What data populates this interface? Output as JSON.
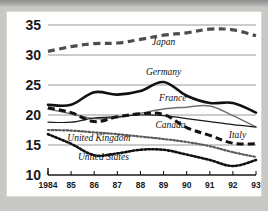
{
  "chart_data": {
    "type": "line",
    "title": "",
    "subtitle": "",
    "xlabel": "",
    "ylabel": "",
    "x": [
      1984,
      1985,
      1986,
      1987,
      1988,
      1989,
      1990,
      1991,
      1992,
      1993
    ],
    "xtick_labels": [
      "1984",
      "85",
      "86",
      "87",
      "88",
      "89",
      "90",
      "91",
      "92",
      "93"
    ],
    "ytick_labels": [
      "35",
      "30",
      "25",
      "20",
      "15",
      "10"
    ],
    "ytick_values": [
      35,
      30,
      25,
      20,
      15,
      10
    ],
    "ylim": [
      10,
      35
    ],
    "xlim": [
      1984,
      1993
    ],
    "grid": true,
    "legend_position": "inline-annotations",
    "series": [
      {
        "name": "Japan",
        "label": "Japan",
        "style": "thick-dashed",
        "color": "#4d4d4d",
        "values": [
          30.6,
          31.4,
          31.9,
          32.0,
          32.6,
          33.3,
          33.7,
          34.3,
          34.2,
          33.2
        ]
      },
      {
        "name": "Germany",
        "label": "Germany",
        "style": "thick-solid",
        "color": "#111111",
        "values": [
          21.7,
          21.7,
          23.8,
          23.4,
          24.0,
          25.5,
          23.2,
          22.0,
          22.0,
          20.4
        ]
      },
      {
        "name": "France",
        "label": "France",
        "style": "thin-solid",
        "color": "#707070",
        "values": [
          21.0,
          20.2,
          19.4,
          19.6,
          20.3,
          21.0,
          21.3,
          21.5,
          19.9,
          18.0
        ]
      },
      {
        "name": "Italy",
        "label": "Italy",
        "style": "thick-dashed-black",
        "color": "#111111",
        "values": [
          21.2,
          20.4,
          18.9,
          19.7,
          20.2,
          20.1,
          17.9,
          16.6,
          15.3,
          15.2
        ]
      },
      {
        "name": "Canada",
        "label": "Canada",
        "style": "thin-solid-black",
        "color": "#1a1a1a",
        "values": [
          18.8,
          18.8,
          19.5,
          19.7,
          20.0,
          19.9,
          19.4,
          18.9,
          18.4,
          18.0
        ]
      },
      {
        "name": "United Kingdom",
        "label": "United Kingdom",
        "style": "dotted-gray",
        "color": "#5a5a5a",
        "values": [
          17.5,
          17.4,
          17.1,
          16.8,
          16.4,
          16.0,
          15.5,
          14.8,
          13.8,
          13.0
        ]
      },
      {
        "name": "United States",
        "label": "United States",
        "style": "dotted-black",
        "color": "#111111",
        "values": [
          16.8,
          15.2,
          13.3,
          13.6,
          14.2,
          14.2,
          13.4,
          12.5,
          11.5,
          12.5
        ]
      }
    ],
    "annotations": [
      {
        "text": "Japan",
        "x_index": 5.0,
        "y_value": 31.6
      },
      {
        "text": "Germany",
        "x_index": 5.0,
        "y_value": 26.6
      },
      {
        "text": "France",
        "x_index": 5.4,
        "y_value": 22.4
      },
      {
        "text": "Canada",
        "x_index": 5.3,
        "y_value": 17.9
      },
      {
        "text": "Italy",
        "x_index": 8.2,
        "y_value": 16.2
      },
      {
        "text": "United Kingdom",
        "x_index": 2.2,
        "y_value": 15.7
      },
      {
        "text": "United States",
        "x_index": 2.4,
        "y_value": 12.5
      }
    ]
  }
}
